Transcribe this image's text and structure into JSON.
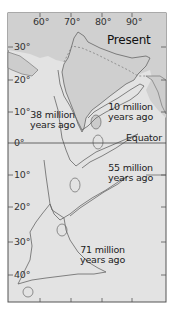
{
  "map": {
    "title": "Present",
    "longitude_labels": [
      "60°",
      "70°",
      "80°",
      "90°"
    ],
    "latitude_labels": [
      "30°",
      "20°",
      "10°",
      "0°",
      "10°",
      "20°",
      "30°",
      "40°"
    ],
    "equator_label": "Equator",
    "positions": [
      {
        "line1": "10 million",
        "line2": "years ago"
      },
      {
        "line1": "38 million",
        "line2": "years ago"
      },
      {
        "line1": "55 million",
        "line2": "years ago"
      },
      {
        "line1": "71 million",
        "line2": "years ago"
      }
    ],
    "colors": {
      "ocean": "#e2e2e2",
      "land": "#cfcfcf",
      "outline": "#6a6a6a",
      "frame": "#555555",
      "text": "#222222"
    }
  }
}
